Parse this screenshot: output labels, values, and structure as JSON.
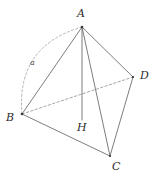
{
  "figure": {
    "type": "geometry-diagram",
    "stroke_color": "#6e6e6e",
    "dashed_color": "#9a9a9a",
    "label_color": "#2b2b2b",
    "background": "#ffffff",
    "vertices": [
      {
        "id": "A",
        "label": "A",
        "x": 82,
        "y": 27,
        "label_x": 77,
        "label_y": 8
      },
      {
        "id": "B",
        "label": "B",
        "x": 22,
        "y": 114,
        "label_x": 6,
        "label_y": 112
      },
      {
        "id": "C",
        "label": "C",
        "x": 110,
        "y": 156,
        "label_x": 112,
        "label_y": 161
      },
      {
        "id": "D",
        "label": "D",
        "x": 133,
        "y": 77,
        "label_x": 140,
        "label_y": 70
      },
      {
        "id": "H",
        "label": "H",
        "x": 82,
        "y": 120,
        "label_x": 77,
        "label_y": 122
      }
    ],
    "edges": [
      {
        "id": "AB",
        "from": "A",
        "to": "B",
        "style": "solid"
      },
      {
        "id": "AC",
        "from": "A",
        "to": "C",
        "style": "solid"
      },
      {
        "id": "AD",
        "from": "A",
        "to": "D",
        "style": "solid"
      },
      {
        "id": "AH",
        "from": "A",
        "to": "H",
        "style": "solid"
      },
      {
        "id": "BC",
        "from": "B",
        "to": "C",
        "style": "solid"
      },
      {
        "id": "CD",
        "from": "C",
        "to": "D",
        "style": "solid"
      },
      {
        "id": "BD",
        "from": "B",
        "to": "D",
        "style": "dashed"
      }
    ],
    "arc": {
      "id": "arc-a",
      "label": "a",
      "from": "A",
      "to": "B",
      "control_x": 16,
      "control_y": 46,
      "style": "dashed",
      "label_x": 30,
      "label_y": 59
    }
  }
}
